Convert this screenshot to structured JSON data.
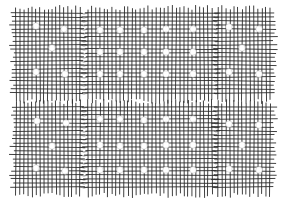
{
  "image": {
    "description": "Line drawing of a woven mesh fabric divided into six panels with white circular dots and frayed fringe edges",
    "colors": {
      "background": "#ffffff",
      "thread": "#2a2a2a",
      "dot": "#ffffff"
    },
    "panels": [
      {
        "id": "top-left",
        "x": 16,
        "y": 13,
        "w": 64,
        "h": 83,
        "dots": [
          [
            36,
            26
          ],
          [
            64,
            29
          ],
          [
            52,
            48
          ],
          [
            36,
            72
          ],
          [
            65,
            74
          ]
        ]
      },
      {
        "id": "top-middle",
        "x": 88,
        "y": 13,
        "w": 126,
        "h": 83,
        "dots": [
          [
            100,
            30
          ],
          [
            120,
            30
          ],
          [
            144,
            30
          ],
          [
            166,
            29
          ],
          [
            193,
            29
          ],
          [
            100,
            52
          ],
          [
            120,
            52
          ],
          [
            144,
            52
          ],
          [
            166,
            52
          ],
          [
            193,
            52
          ],
          [
            100,
            74
          ],
          [
            120,
            74
          ],
          [
            144,
            74
          ],
          [
            166,
            74
          ],
          [
            193,
            74
          ]
        ]
      },
      {
        "id": "top-right",
        "x": 218,
        "y": 13,
        "w": 53,
        "h": 83,
        "dots": [
          [
            229,
            27
          ],
          [
            259,
            29
          ],
          [
            242,
            48
          ],
          [
            229,
            72
          ],
          [
            259,
            74
          ]
        ]
      },
      {
        "id": "bottom-left",
        "x": 16,
        "y": 107,
        "w": 64,
        "h": 83,
        "dots": [
          [
            37,
            121
          ],
          [
            66,
            123
          ],
          [
            52,
            146
          ],
          [
            36,
            168
          ],
          [
            65,
            171
          ]
        ]
      },
      {
        "id": "bottom-middle",
        "x": 88,
        "y": 107,
        "w": 126,
        "h": 83,
        "dots": [
          [
            100,
            119
          ],
          [
            120,
            119
          ],
          [
            144,
            120
          ],
          [
            166,
            119
          ],
          [
            193,
            119
          ],
          [
            100,
            145
          ],
          [
            120,
            146
          ],
          [
            144,
            146
          ],
          [
            166,
            145
          ],
          [
            193,
            145
          ],
          [
            100,
            170
          ],
          [
            120,
            170
          ],
          [
            144,
            170
          ],
          [
            166,
            170
          ],
          [
            193,
            170
          ]
        ]
      },
      {
        "id": "bottom-right",
        "x": 218,
        "y": 107,
        "w": 53,
        "h": 83,
        "dots": [
          [
            229,
            124
          ],
          [
            259,
            125
          ],
          [
            242,
            145
          ],
          [
            229,
            169
          ],
          [
            259,
            170
          ]
        ]
      }
    ],
    "grid_spacing": 4,
    "dot_radius": 3.2
  }
}
